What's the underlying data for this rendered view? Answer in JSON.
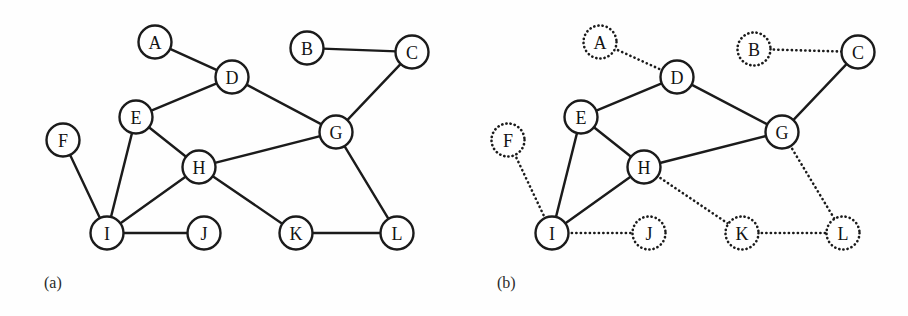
{
  "figure": {
    "background_color": "#fefefe",
    "ink_color": "#1b1b1b",
    "width": 908,
    "height": 316,
    "node_radius": 16.5
  },
  "panels": [
    {
      "id": "panel-a",
      "caption": "(a)",
      "caption_x": 44,
      "caption_y": 274,
      "description": "undirected graph, all nodes and edges drawn with solid strokes",
      "nodes": [
        {
          "label": "A",
          "x": 155,
          "y": 42,
          "style": "solid"
        },
        {
          "label": "B",
          "x": 307,
          "y": 48,
          "style": "solid"
        },
        {
          "label": "C",
          "x": 412,
          "y": 52,
          "style": "solid"
        },
        {
          "label": "D",
          "x": 232,
          "y": 77,
          "style": "solid"
        },
        {
          "label": "E",
          "x": 136,
          "y": 117,
          "style": "solid"
        },
        {
          "label": "F",
          "x": 63,
          "y": 140,
          "style": "solid"
        },
        {
          "label": "G",
          "x": 336,
          "y": 132,
          "style": "solid"
        },
        {
          "label": "H",
          "x": 199,
          "y": 167,
          "style": "solid"
        },
        {
          "label": "I",
          "x": 107,
          "y": 233,
          "style": "solid"
        },
        {
          "label": "J",
          "x": 204,
          "y": 233,
          "style": "solid"
        },
        {
          "label": "K",
          "x": 296,
          "y": 233,
          "style": "solid"
        },
        {
          "label": "L",
          "x": 397,
          "y": 233,
          "style": "solid"
        }
      ],
      "edges": [
        {
          "from": "A",
          "to": "D",
          "style": "solid"
        },
        {
          "from": "B",
          "to": "C",
          "style": "solid"
        },
        {
          "from": "C",
          "to": "G",
          "style": "solid"
        },
        {
          "from": "D",
          "to": "E",
          "style": "solid"
        },
        {
          "from": "D",
          "to": "G",
          "style": "solid"
        },
        {
          "from": "E",
          "to": "H",
          "style": "solid"
        },
        {
          "from": "E",
          "to": "I",
          "style": "solid"
        },
        {
          "from": "F",
          "to": "I",
          "style": "solid"
        },
        {
          "from": "G",
          "to": "H",
          "style": "solid"
        },
        {
          "from": "G",
          "to": "L",
          "style": "solid"
        },
        {
          "from": "H",
          "to": "I",
          "style": "solid"
        },
        {
          "from": "H",
          "to": "K",
          "style": "solid"
        },
        {
          "from": "I",
          "to": "J",
          "style": "solid"
        },
        {
          "from": "K",
          "to": "L",
          "style": "solid"
        }
      ]
    },
    {
      "id": "panel-b",
      "caption": "(b)",
      "caption_x": 497,
      "caption_y": 274,
      "description": "same graph with a subset of nodes and edges highlighted solid; the remainder drawn dotted",
      "nodes": [
        {
          "label": "A",
          "x": 600,
          "y": 42,
          "style": "dotted"
        },
        {
          "label": "B",
          "x": 754,
          "y": 49,
          "style": "dotted"
        },
        {
          "label": "C",
          "x": 858,
          "y": 52,
          "style": "solid"
        },
        {
          "label": "D",
          "x": 677,
          "y": 77,
          "style": "solid"
        },
        {
          "label": "E",
          "x": 581,
          "y": 117,
          "style": "solid"
        },
        {
          "label": "F",
          "x": 508,
          "y": 140,
          "style": "dotted"
        },
        {
          "label": "G",
          "x": 782,
          "y": 132,
          "style": "solid"
        },
        {
          "label": "H",
          "x": 644,
          "y": 167,
          "style": "solid"
        },
        {
          "label": "I",
          "x": 552,
          "y": 233,
          "style": "solid"
        },
        {
          "label": "J",
          "x": 649,
          "y": 233,
          "style": "dotted"
        },
        {
          "label": "K",
          "x": 742,
          "y": 233,
          "style": "dotted"
        },
        {
          "label": "L",
          "x": 843,
          "y": 233,
          "style": "dotted"
        }
      ],
      "edges": [
        {
          "from": "A",
          "to": "D",
          "style": "dotted"
        },
        {
          "from": "B",
          "to": "C",
          "style": "dotted"
        },
        {
          "from": "C",
          "to": "G",
          "style": "solid"
        },
        {
          "from": "D",
          "to": "E",
          "style": "solid"
        },
        {
          "from": "D",
          "to": "G",
          "style": "solid"
        },
        {
          "from": "E",
          "to": "H",
          "style": "solid"
        },
        {
          "from": "E",
          "to": "I",
          "style": "solid"
        },
        {
          "from": "F",
          "to": "I",
          "style": "dotted"
        },
        {
          "from": "G",
          "to": "H",
          "style": "solid"
        },
        {
          "from": "G",
          "to": "L",
          "style": "dotted"
        },
        {
          "from": "H",
          "to": "I",
          "style": "solid"
        },
        {
          "from": "H",
          "to": "K",
          "style": "dotted"
        },
        {
          "from": "I",
          "to": "J",
          "style": "dotted"
        },
        {
          "from": "K",
          "to": "L",
          "style": "dotted"
        }
      ]
    }
  ]
}
